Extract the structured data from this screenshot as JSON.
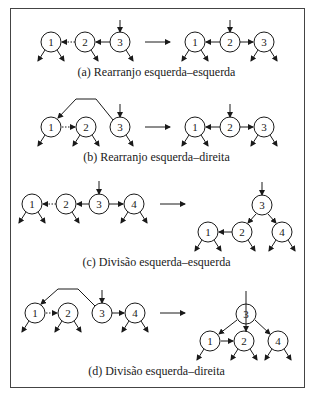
{
  "panels": [
    {
      "id": "a",
      "caption": "(a) Rearranjo esquerda–esquerda",
      "caption_y": 72,
      "before": {
        "nodes": [
          {
            "label": "1",
            "x": 51,
            "y": 42
          },
          {
            "label": "2",
            "x": 85,
            "y": 42
          },
          {
            "label": "3",
            "x": 120,
            "y": 42
          }
        ],
        "edges": [
          {
            "from": [
              110,
              42
            ],
            "to": [
              96,
              42
            ],
            "dashed": false
          },
          {
            "from": [
              75,
              42
            ],
            "to": [
              62,
              42
            ],
            "dashed": true
          }
        ],
        "entry": {
          "x": 120,
          "y": 20
        },
        "children": [
          [
            51,
            "both"
          ],
          [
            85,
            "right"
          ],
          [
            120,
            "right"
          ]
        ],
        "curve": null
      },
      "transform_arrow": {
        "x1": 145,
        "x2": 170,
        "y": 42
      },
      "after": {
        "nodes": [
          {
            "label": "1",
            "x": 195,
            "y": 42
          },
          {
            "label": "2",
            "x": 230,
            "y": 42
          },
          {
            "label": "3",
            "x": 264,
            "y": 42
          }
        ],
        "edges": [
          {
            "from": [
              220,
              42
            ],
            "to": [
              206,
              42
            ],
            "dashed": false
          },
          {
            "from": [
              240,
              42
            ],
            "to": [
              253,
              42
            ],
            "dashed": false
          }
        ],
        "entry": {
          "x": 230,
          "y": 20
        },
        "children": [
          [
            195,
            "both"
          ],
          [
            264,
            "both"
          ]
        ],
        "child_y": 42
      }
    },
    {
      "id": "b",
      "caption": "(b) Rearranjo esquerda–direita",
      "caption_y": 157,
      "before": {
        "nodes": [
          {
            "label": "1",
            "x": 51,
            "y": 127
          },
          {
            "label": "2",
            "x": 86,
            "y": 127
          },
          {
            "label": "3",
            "x": 120,
            "y": 127
          }
        ],
        "edges": [
          {
            "from": [
              62,
              127
            ],
            "to": [
              75,
              127
            ],
            "dashed": true
          }
        ],
        "entry": {
          "x": 120,
          "y": 104
        },
        "children": [
          [
            51,
            "left"
          ],
          [
            86,
            "both"
          ],
          [
            120,
            "right"
          ]
        ],
        "curve": "M113,120 L96,99 L76,99 L58,118"
      },
      "transform_arrow": {
        "x1": 145,
        "x2": 170,
        "y": 127
      },
      "after": {
        "nodes": [
          {
            "label": "1",
            "x": 195,
            "y": 127
          },
          {
            "label": "2",
            "x": 230,
            "y": 127
          },
          {
            "label": "3",
            "x": 264,
            "y": 127
          }
        ],
        "edges": [
          {
            "from": [
              220,
              127
            ],
            "to": [
              206,
              127
            ],
            "dashed": false
          },
          {
            "from": [
              240,
              127
            ],
            "to": [
              253,
              127
            ],
            "dashed": false
          }
        ],
        "entry": {
          "x": 230,
          "y": 104
        },
        "children": [
          [
            195,
            "both"
          ],
          [
            264,
            "both"
          ]
        ],
        "child_y": 127
      }
    },
    {
      "id": "c",
      "caption": "(c) Divisão esquerda–esquerda",
      "caption_y": 262,
      "before": {
        "nodes": [
          {
            "label": "1",
            "x": 32,
            "y": 204
          },
          {
            "label": "2",
            "x": 66,
            "y": 204
          },
          {
            "label": "3",
            "x": 99,
            "y": 204
          },
          {
            "label": "4",
            "x": 134,
            "y": 204
          }
        ],
        "edges": [
          {
            "from": [
              56,
              204
            ],
            "to": [
              43,
              204
            ],
            "dashed": true
          },
          {
            "from": [
              89,
              204
            ],
            "to": [
              77,
              204
            ],
            "dashed": false
          },
          {
            "from": [
              109,
              204
            ],
            "to": [
              123,
              204
            ],
            "dashed": false
          }
        ],
        "entry": {
          "x": 99,
          "y": 181
        },
        "children": [
          [
            32,
            "both"
          ],
          [
            66,
            "right"
          ],
          [
            134,
            "both"
          ]
        ],
        "curve": null
      },
      "transform_arrow": {
        "x1": 160,
        "x2": 185,
        "y": 204
      },
      "after": {
        "nodes": [
          {
            "label": "3",
            "x": 262,
            "y": 205
          },
          {
            "label": "2",
            "x": 242,
            "y": 232
          },
          {
            "label": "4",
            "x": 282,
            "y": 232
          },
          {
            "label": "1",
            "x": 208,
            "y": 232
          }
        ],
        "edges": [
          {
            "from": [
              256,
              214
            ],
            "to": [
              248,
              223
            ],
            "dashed": false
          },
          {
            "from": [
              268,
              214
            ],
            "to": [
              276,
              223
            ],
            "dashed": false
          },
          {
            "from": [
              232,
              232
            ],
            "to": [
              219,
              232
            ],
            "dashed": false
          }
        ],
        "entry": {
          "x": 262,
          "y": 182
        },
        "children": [
          [
            208,
            "both"
          ],
          [
            242,
            "right"
          ],
          [
            282,
            "both"
          ]
        ],
        "child_y": 232
      }
    },
    {
      "id": "d",
      "caption": "(d) Divisão esquerda–direita",
      "caption_y": 371,
      "before": {
        "nodes": [
          {
            "label": "1",
            "x": 35,
            "y": 313
          },
          {
            "label": "2",
            "x": 68,
            "y": 313
          },
          {
            "label": "3",
            "x": 102,
            "y": 313
          },
          {
            "label": "4",
            "x": 135,
            "y": 313
          }
        ],
        "edges": [
          {
            "from": [
              46,
              313
            ],
            "to": [
              57,
              313
            ],
            "dashed": true
          },
          {
            "from": [
              112,
              313
            ],
            "to": [
              124,
              313
            ],
            "dashed": false
          }
        ],
        "entry": {
          "x": 102,
          "y": 290
        },
        "children": [
          [
            35,
            "left"
          ],
          [
            68,
            "both"
          ],
          [
            135,
            "both"
          ]
        ],
        "curve": "M95,306 L78,289 L58,289 L41,304"
      },
      "transform_arrow": {
        "x1": 160,
        "x2": 185,
        "y": 313
      },
      "after": {
        "nodes": [
          {
            "label": "3",
            "x": 246,
            "y": 314
          },
          {
            "label": "1",
            "x": 210,
            "y": 341
          },
          {
            "label": "2",
            "x": 244,
            "y": 341
          },
          {
            "label": "4",
            "x": 278,
            "y": 341
          }
        ],
        "edges": [
          {
            "from": [
              237,
              320
            ],
            "to": [
              219,
              334
            ],
            "dashed": false
          },
          {
            "from": [
              255,
              320
            ],
            "to": [
              270,
              334
            ],
            "dashed": false
          },
          {
            "from": [
              221,
              341
            ],
            "to": [
              233,
              341
            ],
            "dashed": false
          }
        ],
        "entry": {
          "x": 246,
          "y": 291
        },
        "children": [
          [
            210,
            "left"
          ],
          [
            244,
            "both"
          ],
          [
            278,
            "both"
          ]
        ],
        "child_y": 341
      }
    }
  ],
  "style": {
    "stroke": "#1a1a1a",
    "node_radius": 10
  }
}
